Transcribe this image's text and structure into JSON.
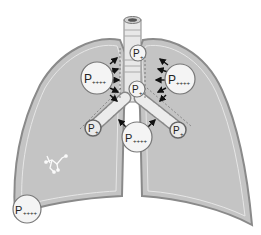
{
  "diagram": {
    "colors": {
      "lung_fill": "#c4c4c4",
      "lung_outline": "#8a8a8a",
      "airway_fill": "#e8e8e8",
      "bubble_fill": "#f4f4f4",
      "arrow": "#111111"
    },
    "labels": {
      "trachea_upper": {
        "base": "P",
        "sub": "+"
      },
      "trachea_lower": {
        "base": "P",
        "sub": "+"
      },
      "left_lung_upper": {
        "base": "P",
        "sub": "++++"
      },
      "right_lung_upper": {
        "base": "P",
        "sub": "++++"
      },
      "left_bronchus": {
        "base": "P",
        "sub": "+"
      },
      "right_bronchus": {
        "base": "P",
        "sub": "+"
      },
      "mediastinum": {
        "base": "P",
        "sub": "++++"
      },
      "left_lung_base": {
        "base": "P",
        "sub": "++++"
      }
    }
  }
}
